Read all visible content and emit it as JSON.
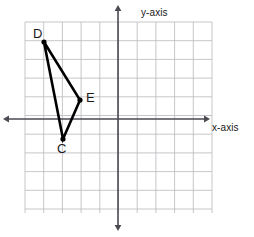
{
  "figure": {
    "width": 254,
    "height": 237,
    "background": "#ffffff"
  },
  "grid": {
    "left": 25,
    "top": 22,
    "right": 212,
    "bottom": 213,
    "cell": 18.7,
    "columns": 10,
    "rows": 10,
    "line_color": "#b9b9bd",
    "line_width": 0.8
  },
  "axes": {
    "color": "#4a4a52",
    "line_width": 1.6,
    "x_axis": {
      "label": "x-axis",
      "y_pixel": 119,
      "start_x": 8,
      "end_x": 205,
      "arrows": "both"
    },
    "y_axis": {
      "label": "y-axis",
      "x_pixel": 118,
      "start_y": 10,
      "end_y": 226,
      "arrows": "both"
    },
    "origin_pixel": {
      "x": 118,
      "y": 119
    }
  },
  "chart_data": {
    "type": "scatter",
    "title": "",
    "xlabel": "x-axis",
    "ylabel": "y-axis",
    "xlim": [
      -5,
      5
    ],
    "ylim": [
      -5,
      5
    ],
    "grid": true,
    "legend": "none",
    "shape": {
      "name": "triangle-CDE",
      "closed": true,
      "stroke": "#000000",
      "stroke_width": 2.6,
      "vertex_order": [
        "D",
        "E",
        "C"
      ]
    },
    "points": [
      {
        "label": "D",
        "x": -4,
        "y": 4,
        "px": 44,
        "py": 42,
        "label_dx": -11,
        "label_dy": -16
      },
      {
        "label": "E",
        "x": -2,
        "y": 1,
        "px": 80,
        "py": 100,
        "label_dx": 6,
        "label_dy": -10
      },
      {
        "label": "C",
        "x": -3,
        "y": -1,
        "px": 63,
        "py": 139,
        "label_dx": -6,
        "label_dy": 2
      }
    ],
    "point_marker": {
      "shape": "circle",
      "radius": 2.6,
      "color": "#000000"
    }
  }
}
